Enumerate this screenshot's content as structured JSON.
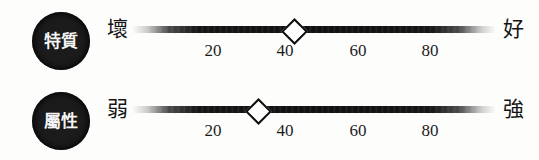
{
  "diagram": {
    "title": "",
    "colors": {
      "badge_fill": "#1b1b1b",
      "badge_text": "#f4f4f4",
      "bar": "#101010",
      "handle_fill": "#ffffff",
      "handle_stroke": "#0d0d0d",
      "text": "#141414",
      "background": "#fdfdfc"
    },
    "scale": {
      "min": 0,
      "max": 100,
      "ticks": [
        {
          "value": 20,
          "label": "20",
          "x": 213
        },
        {
          "value": 40,
          "label": "40",
          "x": 285
        },
        {
          "value": 60,
          "label": "60",
          "x": 358
        },
        {
          "value": 80,
          "label": "80",
          "x": 430
        }
      ]
    },
    "rows": [
      {
        "badge": "特質",
        "left_pole": "壞",
        "right_pole": "好",
        "handle_value": 40,
        "handle_x": 292
      },
      {
        "badge": "屬性",
        "left_pole": "弱",
        "right_pole": "強",
        "handle_value": 30,
        "handle_x": 256
      }
    ]
  }
}
